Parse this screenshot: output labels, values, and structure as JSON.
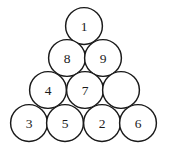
{
  "figure": {
    "background_color": "#ffffff",
    "stroke_color": "#1a1a1a",
    "label_color": "#1a1a1a",
    "circle_fill": "#ffffff",
    "circle_radius": 18.4,
    "stroke_width": 1.45,
    "total_circles": 10,
    "rows": 4,
    "rows_data": [
      {
        "row_index": 1,
        "count": 1,
        "cy": 26,
        "circles": [
          {
            "label": "1",
            "cx": 84,
            "cy": 26,
            "empty": false
          }
        ]
      },
      {
        "row_index": 2,
        "count": 2,
        "cy": 58,
        "circles": [
          {
            "label": "8",
            "cx": 67,
            "cy": 58,
            "empty": false
          },
          {
            "label": "9",
            "cx": 103,
            "cy": 58,
            "empty": false
          }
        ]
      },
      {
        "row_index": 3,
        "count": 3,
        "cy": 90,
        "circles": [
          {
            "label": "4",
            "cx": 48,
            "cy": 90,
            "empty": false
          },
          {
            "label": "7",
            "cx": 85,
            "cy": 90,
            "empty": false
          },
          {
            "label": "",
            "cx": 121,
            "cy": 90,
            "empty": true
          }
        ]
      },
      {
        "row_index": 4,
        "count": 4,
        "cy": 123,
        "circles": [
          {
            "label": "3",
            "cx": 29,
            "cy": 123,
            "empty": false
          },
          {
            "label": "5",
            "cx": 65,
            "cy": 123,
            "empty": false
          },
          {
            "label": "2",
            "cx": 102,
            "cy": 123,
            "empty": false
          },
          {
            "label": "6",
            "cx": 138,
            "cy": 123,
            "empty": false
          }
        ]
      }
    ],
    "labels_in_reading_order": [
      "1",
      "8",
      "9",
      "4",
      "7",
      "",
      "3",
      "5",
      "2",
      "6"
    ]
  }
}
